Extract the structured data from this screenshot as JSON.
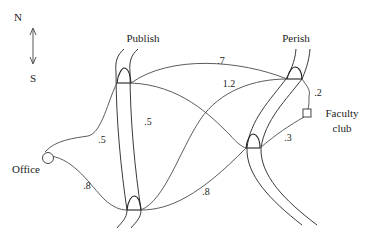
{
  "compass": {
    "north": "N",
    "south": "S"
  },
  "rivers": [
    {
      "name": "Publish",
      "label": "Publish"
    },
    {
      "name": "Perish",
      "label": "Perish"
    }
  ],
  "places": {
    "office": "Office",
    "faculty_club_line1": "Faculty",
    "faculty_club_line2": "club"
  },
  "edges": [
    {
      "id": "office-publish-top",
      "weight": ".5"
    },
    {
      "id": "publish-top-perish-lower",
      "weight": ".5"
    },
    {
      "id": "publish-top-perish-top",
      "weight": ".7"
    },
    {
      "id": "publish-bottom-perish-top",
      "weight": "1.2"
    },
    {
      "id": "perish-top-faculty",
      "weight": ".2"
    },
    {
      "id": "perish-lower-faculty",
      "weight": ".3"
    },
    {
      "id": "office-publish-bottom",
      "weight": ".8"
    },
    {
      "id": "publish-bottom-perish-lower",
      "weight": ".8"
    }
  ]
}
